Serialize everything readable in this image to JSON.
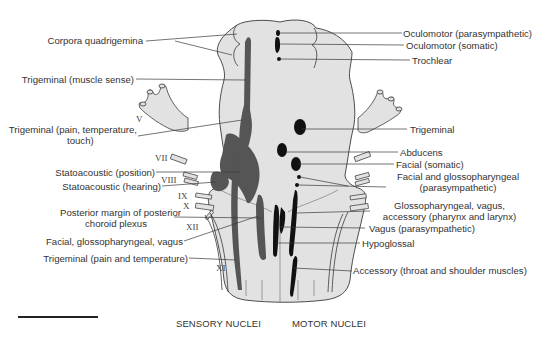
{
  "diagram": {
    "colors": {
      "background": "#ffffff",
      "brainstem_fill": "#e2e2e2",
      "outline": "#3a3a3a",
      "sensory_nuclei": "#555555",
      "motor_nuclei": "#111111",
      "leader_lines": "#3a3a3a"
    },
    "left_labels": [
      {
        "id": "corpora-quadrigemina",
        "text": "Corpora quadrigemina"
      },
      {
        "id": "trigeminal-muscle-sense",
        "text": "Trigeminal (muscle sense)"
      },
      {
        "id": "trigeminal-pain-temp-touch-1",
        "text": "Trigeminal (pain, temperature,"
      },
      {
        "id": "trigeminal-pain-temp-touch-2",
        "text": "touch)"
      },
      {
        "id": "statoacoustic-position",
        "text": "Statoacoustic (position)"
      },
      {
        "id": "statoacoustic-hearing",
        "text": "Statoacoustic (hearing)"
      },
      {
        "id": "posterior-margin-1",
        "text": "Posterior margin of posterior"
      },
      {
        "id": "posterior-margin-2",
        "text": "choroid plexus"
      },
      {
        "id": "facial-glosso-vagus",
        "text": "Facial, glossopharyngeal, vagus"
      },
      {
        "id": "trigeminal-pain-temp",
        "text": "Trigeminal (pain and temperature)"
      }
    ],
    "right_labels": [
      {
        "id": "oculomotor-parasympathetic",
        "text": "Oculomotor (parasympathetic)"
      },
      {
        "id": "oculomotor-somatic",
        "text": "Oculomotor (somatic)"
      },
      {
        "id": "trochlear",
        "text": "Trochlear"
      },
      {
        "id": "trigeminal",
        "text": "Trigeminal"
      },
      {
        "id": "abducens",
        "text": "Abducens"
      },
      {
        "id": "facial-somatic",
        "text": "Facial (somatic)"
      },
      {
        "id": "facial-glosso-parasym-1",
        "text": "Facial and glossopharyngeal"
      },
      {
        "id": "facial-glosso-parasym-2",
        "text": "(parasympathetic)"
      },
      {
        "id": "glosso-vagus-accessory-1",
        "text": "Glossopharyngeal, vagus,"
      },
      {
        "id": "glosso-vagus-accessory-2",
        "text": "accessory (pharynx and larynx)"
      },
      {
        "id": "vagus-parasympathetic",
        "text": "Vagus (parasympathetic)"
      },
      {
        "id": "hypoglossal",
        "text": "Hypoglossal"
      },
      {
        "id": "accessory-throat-shoulder",
        "text": "Accessory (throat and shoulder muscles)"
      }
    ],
    "cranial_nerve_numerals": [
      "V",
      "VII",
      "VIII",
      "IX",
      "X",
      "XII",
      "XI"
    ],
    "captions": {
      "sensory": "SENSORY NUCLEI",
      "motor": "MOTOR NUCLEI"
    }
  }
}
